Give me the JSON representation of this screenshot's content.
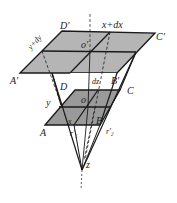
{
  "diagram": {
    "type": "geometric-projection",
    "colors": {
      "upper_plane_fill": "#b5b5b5",
      "lower_plane_fill": "#9a9a9a",
      "band_fill": "#ffffff",
      "line": "#1a1a1a",
      "background": "#ffffff"
    },
    "labels": {
      "D_prime": "D'",
      "C_prime": "C'",
      "A_prime": "A'",
      "B_prime": "B'",
      "x_plus_dx": "x+dx",
      "y_plus_dy": "y+dy",
      "o_prime": "o'",
      "dz": "dz",
      "D": "D",
      "C": "C",
      "A": "A",
      "B": "B",
      "o": "o",
      "y": "y",
      "x": "x",
      "r1": "r'₁",
      "r2": "r'₂",
      "z": "z"
    }
  }
}
